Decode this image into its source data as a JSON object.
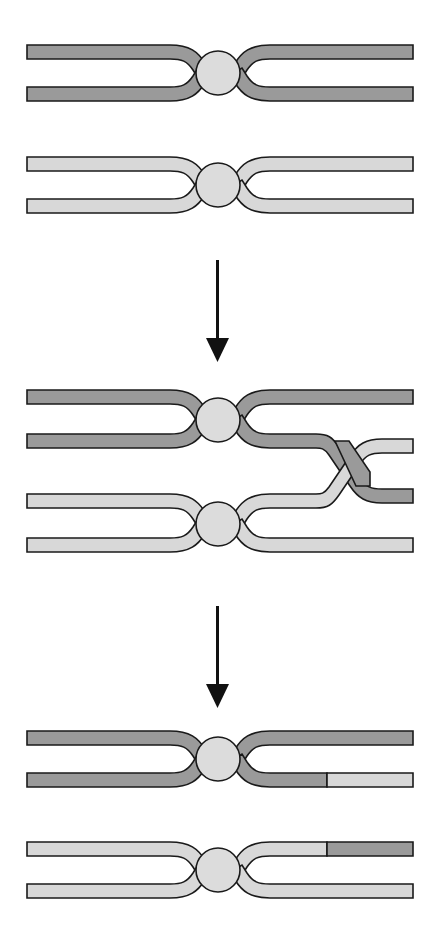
{
  "figure": {
    "domain_note": "schematic line diagram of two DNA duplexes forming junctions, crossing over, and exchanging end segments",
    "canvas": {
      "width": 440,
      "height": 937,
      "background": "#ffffff"
    },
    "colors": {
      "dark_strand": "#9a9a9a",
      "light_strand": "#d8d8d8",
      "junction_node": "#dcdcdc",
      "outline": "#1a1a1a",
      "arrow": "#111111"
    },
    "geometry": {
      "left_end_x": 27,
      "right_end_x": 413,
      "strand_thickness": 14,
      "junction_radius": 22,
      "junction_x": 218,
      "crossover_center_x": 355
    },
    "panels": [
      {
        "id": "panel-1",
        "label": "Stage 1 — two separate duplexes, each pinched at a junction node",
        "duplexes": [
          {
            "id": "panel1-duplex-dark",
            "shade": "dark",
            "upper_strand_y": 52,
            "lower_strand_y": 108,
            "junction_cx": 218,
            "junction_cy": 80,
            "segments": [
              {
                "side": "left",
                "shade": "dark",
                "from_x": 27,
                "to_x": 196
              },
              {
                "side": "right",
                "shade": "dark",
                "from_x": 240,
                "to_x": 413
              }
            ]
          },
          {
            "id": "panel1-duplex-light",
            "shade": "light",
            "upper_strand_y": 163,
            "lower_strand_y": 221,
            "junction_cx": 218,
            "junction_cy": 192,
            "segments": [
              {
                "side": "left",
                "shade": "light",
                "from_x": 27,
                "to_x": 196
              },
              {
                "side": "right",
                "shade": "light",
                "from_x": 240,
                "to_x": 413
              }
            ]
          }
        ]
      },
      {
        "id": "panel-2",
        "label": "Stage 2 — the inner strands of the two duplexes cross over one another at the right",
        "duplexes": [
          {
            "id": "panel2-duplex-dark",
            "shade": "dark",
            "upper_strand_y": 396,
            "lower_strand_y": 454,
            "junction_cx": 218,
            "junction_cy": 425,
            "crossing_strand": "lower"
          },
          {
            "id": "panel2-duplex-light",
            "shade": "light",
            "upper_strand_y": 500,
            "lower_strand_y": 558,
            "junction_cx": 218,
            "junction_cy": 529,
            "crossing_strand": "upper"
          }
        ],
        "crossover": {
          "center_x": 355,
          "start_x": 322,
          "end_x": 389,
          "upper_y": 454,
          "lower_y": 500,
          "over_strand": "dark",
          "under_strand": "light"
        }
      },
      {
        "id": "panel-3",
        "label": "Stage 3 — resolved duplexes, each right-hand inner strand now carries the exchanged segment",
        "duplexes": [
          {
            "id": "panel3-duplex-dark",
            "shade": "dark",
            "upper_strand_y": 738,
            "lower_strand_y": 794,
            "junction_cx": 218,
            "junction_cy": 766,
            "swap_boundary_x": 327,
            "right_lower_segments": [
              {
                "shade": "dark",
                "from_x": 240,
                "to_x": 327
              },
              {
                "shade": "light",
                "from_x": 327,
                "to_x": 413
              }
            ]
          },
          {
            "id": "panel3-duplex-light",
            "shade": "light",
            "upper_strand_y": 849,
            "lower_strand_y": 906,
            "junction_cx": 218,
            "junction_cy": 877,
            "swap_boundary_x": 327,
            "right_upper_segments": [
              {
                "shade": "light",
                "from_x": 240,
                "to_x": 327
              },
              {
                "shade": "dark",
                "from_x": 327,
                "to_x": 413
              }
            ]
          }
        ]
      }
    ],
    "arrows": [
      {
        "id": "arrow-1",
        "x": 218,
        "from_y": 260,
        "to_y": 362,
        "direction": "down"
      },
      {
        "id": "arrow-2",
        "x": 218,
        "from_y": 606,
        "to_y": 708,
        "direction": "down"
      }
    ]
  }
}
